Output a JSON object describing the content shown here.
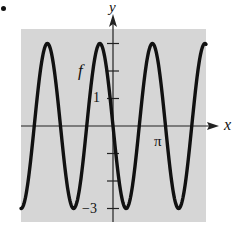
{
  "bullet": "•",
  "chart_data": {
    "type": "line",
    "title": "",
    "xlabel": "x",
    "ylabel": "y",
    "function_label": "f",
    "y_tick_values": [
      3,
      2,
      1,
      0,
      -1,
      -2,
      -3
    ],
    "y_tick_labels_shown": [
      {
        "value": 1,
        "label": "1"
      },
      {
        "value": -3,
        "label": "−3"
      }
    ],
    "x_tick_labels_shown": [
      {
        "value": 3.14159,
        "label": "π"
      }
    ],
    "xlim": [
      -6.15,
      6.2
    ],
    "ylim": [
      -3.5,
      3.5
    ],
    "grid": false,
    "background": "#d9d9d9",
    "series": [
      {
        "name": "f",
        "description": "sinusoid oscillating between -3 and 3, decreasing through the origin",
        "amplitude": 3,
        "period_units": 3.51,
        "x": [
          -6.15,
          -4.41,
          -2.65,
          -0.89,
          0.0,
          0.87,
          2.63,
          4.4,
          6.2
        ],
        "values": [
          -3,
          3,
          -3,
          3,
          0,
          -3,
          3,
          -3,
          2.97
        ]
      }
    ]
  },
  "labels": {
    "y_axis": "y",
    "x_axis": "x",
    "f": "f",
    "one": "1",
    "neg_three": "−3",
    "pi": "π"
  }
}
